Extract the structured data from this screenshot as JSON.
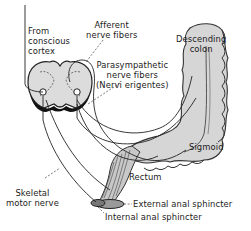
{
  "diagram": {
    "labels": {
      "from_cortex": [
        "From",
        "conscious",
        "cortex"
      ],
      "afferent": [
        "Afferent",
        "nerve fibers"
      ],
      "parasympathetic": [
        "Parasympathetic",
        "nerve fibers",
        "(Nervi erigentes)"
      ],
      "descending_colon": [
        "Descending",
        "colon"
      ],
      "sigmoid": "Sigmoid",
      "rectum": "Rectum",
      "skeletal_motor_nerve": [
        "Skeletal",
        "motor nerve"
      ],
      "external_anal_sphincter": "External anal sphincter",
      "internal_anal_sphincter": "Internal anal sphincter"
    },
    "structures": [
      "spinal-cord-cross-section",
      "descending-colon",
      "sigmoid-colon",
      "rectum",
      "external-anal-sphincter",
      "internal-anal-sphincter"
    ],
    "colors": {
      "line": "#222222",
      "organ_fill": "#d8d8d8",
      "organ_shade": "#bdbdbd",
      "cord_fill": "#dcdcdc",
      "background": "#ffffff"
    }
  }
}
